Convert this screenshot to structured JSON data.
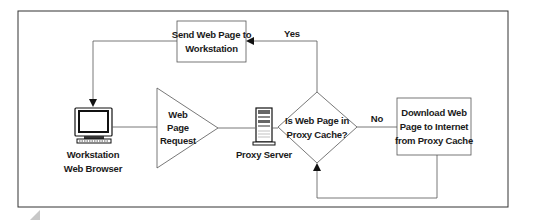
{
  "diagram": {
    "type": "flowchart",
    "nodes": {
      "workstation": {
        "icon": "computer-monitor-icon",
        "label_lines": [
          "Workstation",
          "Web Browser"
        ]
      },
      "request": {
        "shape": "triangle",
        "label_lines": [
          "Web",
          "Page",
          "Request"
        ]
      },
      "proxy_server": {
        "icon": "server-tower-icon",
        "label_lines": [
          "Proxy Server"
        ]
      },
      "decision": {
        "shape": "diamond",
        "label_lines": [
          "Is Web Page in",
          "Proxy Cache?"
        ]
      },
      "send_page": {
        "shape": "rectangle",
        "label_lines": [
          "Send Web Page to",
          "Workstation"
        ]
      },
      "download": {
        "shape": "rectangle",
        "label_lines": [
          "Download Web",
          "Page to Internet",
          "from Proxy Cache"
        ]
      }
    },
    "edges": [
      {
        "from": "workstation",
        "to": "request",
        "label": ""
      },
      {
        "from": "request",
        "to": "proxy_server",
        "label": ""
      },
      {
        "from": "proxy_server",
        "to": "decision",
        "label": ""
      },
      {
        "from": "decision",
        "to": "send_page",
        "label": "Yes"
      },
      {
        "from": "send_page",
        "to": "workstation",
        "label": ""
      },
      {
        "from": "decision",
        "to": "download",
        "label": "No"
      },
      {
        "from": "download",
        "to": "decision",
        "label": ""
      }
    ],
    "edge_labels": {
      "yes": "Yes",
      "no": "No"
    }
  }
}
